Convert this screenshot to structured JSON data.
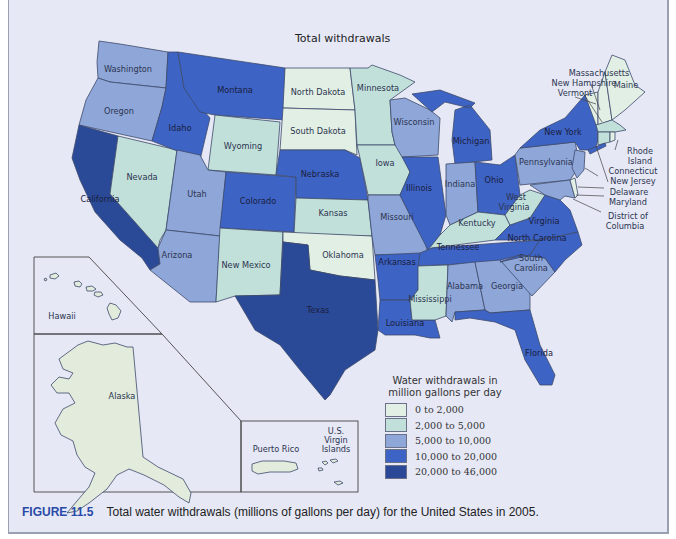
{
  "map": {
    "title": "Total withdrawals",
    "colors": {
      "c1": "#e2efe4",
      "c2": "#c2e0da",
      "c3": "#8ea6d8",
      "c4": "#3d63c4",
      "c5": "#2a4a98",
      "background": "#e6e8f6",
      "inset_fill": "#e2ebdc"
    },
    "states": [
      {
        "name": "Washington",
        "class": "5,000 to 10,000"
      },
      {
        "name": "Oregon",
        "class": "5,000 to 10,000"
      },
      {
        "name": "California",
        "class": "20,000 to 46,000"
      },
      {
        "name": "Nevada",
        "class": "2,000 to 5,000"
      },
      {
        "name": "Idaho",
        "class": "10,000 to 20,000"
      },
      {
        "name": "Montana",
        "class": "10,000 to 20,000"
      },
      {
        "name": "Wyoming",
        "class": "2,000 to 5,000"
      },
      {
        "name": "Utah",
        "class": "5,000 to 10,000"
      },
      {
        "name": "Arizona",
        "class": "5,000 to 10,000"
      },
      {
        "name": "Colorado",
        "class": "10,000 to 20,000"
      },
      {
        "name": "New Mexico",
        "class": "2,000 to 5,000"
      },
      {
        "name": "North Dakota",
        "class": "0 to 2,000"
      },
      {
        "name": "South Dakota",
        "class": "0 to 2,000"
      },
      {
        "name": "Nebraska",
        "class": "10,000 to 20,000"
      },
      {
        "name": "Kansas",
        "class": "2,000 to 5,000"
      },
      {
        "name": "Oklahoma",
        "class": "0 to 2,000"
      },
      {
        "name": "Texas",
        "class": "20,000 to 46,000"
      },
      {
        "name": "Minnesota",
        "class": "2,000 to 5,000"
      },
      {
        "name": "Iowa",
        "class": "2,000 to 5,000"
      },
      {
        "name": "Missouri",
        "class": "5,000 to 10,000"
      },
      {
        "name": "Arkansas",
        "class": "10,000 to 20,000"
      },
      {
        "name": "Louisiana",
        "class": "10,000 to 20,000"
      },
      {
        "name": "Wisconsin",
        "class": "5,000 to 10,000"
      },
      {
        "name": "Illinois",
        "class": "10,000 to 20,000"
      },
      {
        "name": "Michigan",
        "class": "10,000 to 20,000"
      },
      {
        "name": "Indiana",
        "class": "5,000 to 10,000"
      },
      {
        "name": "Ohio",
        "class": "10,000 to 20,000"
      },
      {
        "name": "Kentucky",
        "class": "2,000 to 5,000"
      },
      {
        "name": "Tennessee",
        "class": "10,000 to 20,000"
      },
      {
        "name": "Mississippi",
        "class": "2,000 to 5,000"
      },
      {
        "name": "Alabama",
        "class": "5,000 to 10,000"
      },
      {
        "name": "Georgia",
        "class": "5,000 to 10,000"
      },
      {
        "name": "Florida",
        "class": "10,000 to 20,000"
      },
      {
        "name": "South Carolina",
        "class": "5,000 to 10,000"
      },
      {
        "name": "North Carolina",
        "class": "10,000 to 20,000"
      },
      {
        "name": "Virginia",
        "class": "10,000 to 20,000"
      },
      {
        "name": "West Virginia",
        "class": "2,000 to 5,000"
      },
      {
        "name": "Pennsylvania",
        "class": "5,000 to 10,000"
      },
      {
        "name": "New York",
        "class": "10,000 to 20,000"
      },
      {
        "name": "Vermont",
        "class": "0 to 2,000"
      },
      {
        "name": "New Hampshire",
        "class": "0 to 2,000"
      },
      {
        "name": "Maine",
        "class": "0 to 2,000"
      },
      {
        "name": "Massachusetts",
        "class": "2,000 to 5,000"
      },
      {
        "name": "Rhode Island",
        "class": "0 to 2,000"
      },
      {
        "name": "Connecticut",
        "class": "2,000 to 5,000"
      },
      {
        "name": "New Jersey",
        "class": "5,000 to 10,000"
      },
      {
        "name": "Delaware",
        "class": "0 to 2,000"
      },
      {
        "name": "Maryland",
        "class": "5,000 to 10,000"
      },
      {
        "name": "District of Columbia",
        "class": "0 to 2,000"
      },
      {
        "name": "Hawaii",
        "class": "0 to 2,000"
      },
      {
        "name": "Alaska",
        "class": "0 to 2,000"
      },
      {
        "name": "Puerto Rico",
        "class": "0 to 2,000"
      },
      {
        "name": "U.S. Virgin Islands",
        "class": "0 to 2,000"
      }
    ],
    "labels": {
      "washington": "Washington",
      "oregon": "Oregon",
      "california": "California",
      "nevada": "Nevada",
      "idaho": "Idaho",
      "montana": "Montana",
      "wyoming": "Wyoming",
      "utah": "Utah",
      "arizona": "Arizona",
      "colorado": "Colorado",
      "new_mexico": "New Mexico",
      "north_dakota": "North Dakota",
      "south_dakota": "South Dakota",
      "nebraska": "Nebraska",
      "kansas": "Kansas",
      "oklahoma": "Oklahoma",
      "texas": "Texas",
      "minnesota": "Minnesota",
      "iowa": "Iowa",
      "missouri": "Missouri",
      "arkansas": "Arkansas",
      "louisiana": "Louisiana",
      "wisconsin": "Wisconsin",
      "illinois": "Illinois",
      "michigan": "Michigan",
      "indiana": "Indiana",
      "ohio": "Ohio",
      "kentucky": "Kentucky",
      "tennessee": "Tennessee",
      "mississippi": "Mississippi",
      "alabama": "Alabama",
      "georgia": "Georgia",
      "florida": "Florida",
      "south_carolina_1": "South",
      "south_carolina_2": "Carolina",
      "north_carolina": "North Carolina",
      "virginia": "Virginia",
      "west_virginia_1": "West",
      "west_virginia_2": "Virginia",
      "pennsylvania": "Pennsylvania",
      "new_york": "New York",
      "maine": "Maine",
      "massachusetts": "Massachusetts",
      "new_hampshire": "New Hampshire",
      "vermont": "Vermont",
      "rhode_island_1": "Rhode",
      "rhode_island_2": "Island",
      "connecticut": "Connecticut",
      "new_jersey": "New Jersey",
      "delaware": "Delaware",
      "maryland": "Maryland",
      "dc_1": "District of",
      "dc_2": "Columbia",
      "hawaii": "Hawaii",
      "alaska": "Alaska",
      "puerto_rico": "Puerto Rico",
      "usvi_1": "U.S.",
      "usvi_2": "Virgin",
      "usvi_3": "Islands"
    }
  },
  "legend": {
    "title_line1": "Water withdrawals in",
    "title_line2": "million gallons per day",
    "items": [
      {
        "label": "0 to 2,000",
        "color": "#e2efe4"
      },
      {
        "label": "2,000 to 5,000",
        "color": "#c2e0da"
      },
      {
        "label": "5,000 to 10,000",
        "color": "#8ea6d8"
      },
      {
        "label": "10,000 to 20,000",
        "color": "#3d63c4"
      },
      {
        "label": "20,000 to 46,000",
        "color": "#2a4a98"
      }
    ]
  },
  "caption": {
    "figure_number": "FIGURE 11.5",
    "text": "Total water withdrawals (millions of gallons per day) for the United States in 2005."
  }
}
